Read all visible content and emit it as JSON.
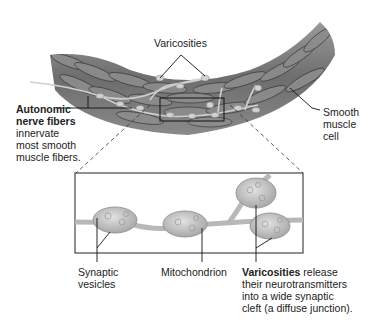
{
  "diagram": {
    "colors": {
      "muscle_dark": "#4a4a4a",
      "muscle_mid": "#7a7a7a",
      "muscle_light": "#b5b5b5",
      "varicosity": "#c8c8c8",
      "line": "#111111"
    },
    "labels": {
      "varicosities_top": "Varicosities",
      "autonomic_title_1": "Autonomic",
      "autonomic_title_2": "nerve fibers",
      "autonomic_desc_1": "innervate",
      "autonomic_desc_2": "most smooth",
      "autonomic_desc_3": "muscle fibers.",
      "smooth_1": "Smooth",
      "smooth_2": "muscle",
      "smooth_3": "cell",
      "synaptic_1": "Synaptic",
      "synaptic_2": "vesicles",
      "mitochondrion": "Mitochondrion",
      "varicosities_bold": "Varicosities",
      "varicosities_desc_1": " release",
      "varicosities_desc_2": "their neurotransmitters",
      "varicosities_desc_3": "into a wide synaptic",
      "varicosities_desc_4": "cleft (a diffuse junction)."
    }
  }
}
